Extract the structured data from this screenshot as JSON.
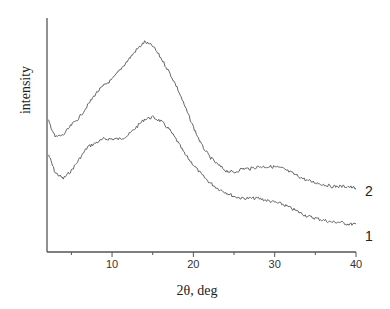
{
  "chart_data": {
    "type": "line",
    "title": "",
    "xlabel": "2θ, deg",
    "ylabel": "intensity",
    "xlim": [
      2,
      40
    ],
    "ylim": [
      0,
      1
    ],
    "x_ticks": [
      10,
      20,
      30,
      40
    ],
    "x_minor_ticks": [
      5,
      15,
      25,
      35
    ],
    "y_ticks": [],
    "grid": false,
    "legend": "inline labels at right end of curves",
    "series": [
      {
        "name": "1",
        "x": [
          2.2,
          3,
          4,
          5,
          6,
          7,
          8,
          9,
          10,
          11,
          12,
          13,
          14,
          15,
          16,
          17,
          18,
          19,
          20,
          21,
          22,
          23,
          24,
          25,
          26,
          27,
          28,
          29,
          30,
          31,
          32,
          33,
          34,
          35,
          36,
          37,
          38,
          39,
          40
        ],
        "values": [
          0.39,
          0.3,
          0.27,
          0.31,
          0.37,
          0.43,
          0.45,
          0.47,
          0.47,
          0.47,
          0.49,
          0.53,
          0.57,
          0.58,
          0.56,
          0.52,
          0.46,
          0.39,
          0.34,
          0.29,
          0.25,
          0.22,
          0.2,
          0.18,
          0.17,
          0.17,
          0.17,
          0.16,
          0.15,
          0.14,
          0.12,
          0.1,
          0.08,
          0.07,
          0.06,
          0.05,
          0.05,
          0.04,
          0.04
        ]
      },
      {
        "name": "2",
        "x": [
          2.2,
          3,
          4,
          5,
          6,
          7,
          8,
          9,
          10,
          11,
          12,
          13,
          14,
          15,
          16,
          17,
          18,
          19,
          20,
          21,
          22,
          23,
          24,
          25,
          26,
          27,
          28,
          29,
          30,
          31,
          32,
          33,
          34,
          35,
          36,
          37,
          38,
          39,
          40
        ],
        "values": [
          0.56,
          0.48,
          0.49,
          0.54,
          0.58,
          0.64,
          0.7,
          0.74,
          0.77,
          0.82,
          0.87,
          0.92,
          0.96,
          0.94,
          0.88,
          0.81,
          0.73,
          0.63,
          0.53,
          0.44,
          0.38,
          0.34,
          0.31,
          0.3,
          0.32,
          0.32,
          0.33,
          0.33,
          0.33,
          0.32,
          0.3,
          0.28,
          0.26,
          0.25,
          0.24,
          0.23,
          0.23,
          0.23,
          0.22
        ]
      }
    ]
  },
  "labels": {
    "xlabel": "2θ, deg",
    "ylabel": "intensity",
    "series_1": "1",
    "series_2": "2",
    "tick_10": "10",
    "tick_20": "20",
    "tick_30": "30",
    "tick_40": "40"
  },
  "colors": {
    "line": "#555555",
    "axis": "#555555",
    "text": "#222222"
  }
}
